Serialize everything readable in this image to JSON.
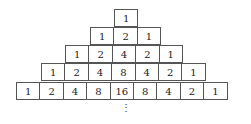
{
  "diagram": {
    "rows": [
      [
        "1"
      ],
      [
        "1",
        "2",
        "1"
      ],
      [
        "1",
        "2",
        "4",
        "2",
        "1"
      ],
      [
        "1",
        "2",
        "4",
        "8",
        "4",
        "2",
        "1"
      ],
      [
        "1",
        "2",
        "4",
        "8",
        "16",
        "8",
        "4",
        "2",
        "1"
      ]
    ],
    "continuation": "⋮"
  }
}
